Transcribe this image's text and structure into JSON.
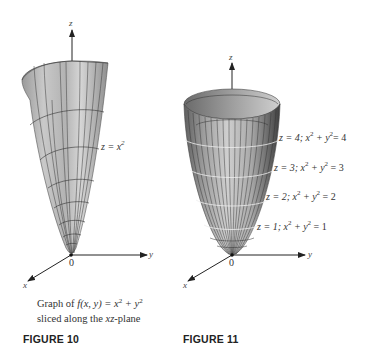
{
  "figure10": {
    "label": "FIGURE 10",
    "caption_line1_prefix": "Graph of ",
    "caption_func": "f(x, y)",
    "caption_eq_tail": " = x",
    "caption_plus": " + y",
    "caption_line2": "sliced along the ",
    "caption_plane": "xz",
    "caption_line2_tail": "-plane",
    "surface_label_lhs": "z = x",
    "surface_label_exp": "2",
    "axes": {
      "z": "z",
      "y": "y",
      "x": "x",
      "origin": "0"
    }
  },
  "figure11": {
    "label": "FIGURE 11",
    "axes": {
      "z": "z",
      "y": "y",
      "x": "x",
      "origin": "0"
    },
    "level_curves": [
      {
        "z": "z = 4; x",
        "mid": " + y",
        "rhs": "= 4"
      },
      {
        "z": "z = 3; x",
        "mid": " + y",
        "rhs": " = 3"
      },
      {
        "z": "z = 2; x",
        "mid": " + y",
        "rhs": " = 2"
      },
      {
        "z": "z = 1; x",
        "mid": " + y",
        "rhs": " = 1"
      }
    ],
    "exp": "2"
  },
  "colors": {
    "surface_light": "#d4d4d4",
    "surface_mid": "#a8a8a8",
    "surface_dark": "#5a5a5a",
    "grid_line": "#3a3a3a",
    "axis": "#222222"
  }
}
